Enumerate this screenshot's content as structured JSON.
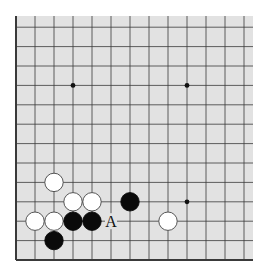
{
  "diagram": {
    "type": "go-board-fragment",
    "board": {
      "background": "#e2e2e2",
      "line_color": "#3a3a3a",
      "columns_visible": 13,
      "rows_visible": 13,
      "edges": [
        "left",
        "bottom"
      ]
    },
    "star_points": [
      {
        "col": 3,
        "row": 9
      },
      {
        "col": 9,
        "row": 9
      },
      {
        "col": 9,
        "row": 3
      }
    ],
    "stones": [
      {
        "color": "white",
        "col": 2,
        "row": 4
      },
      {
        "color": "white",
        "col": 3,
        "row": 3
      },
      {
        "color": "white",
        "col": 4,
        "row": 3
      },
      {
        "color": "white",
        "col": 1,
        "row": 2
      },
      {
        "color": "white",
        "col": 2,
        "row": 2
      },
      {
        "color": "black",
        "col": 3,
        "row": 2
      },
      {
        "color": "black",
        "col": 4,
        "row": 2
      },
      {
        "color": "black",
        "col": 2,
        "row": 1
      },
      {
        "color": "black",
        "col": 6,
        "row": 3
      },
      {
        "color": "white",
        "col": 8,
        "row": 2
      }
    ],
    "markers": [
      {
        "text": "A",
        "col": 5,
        "row": 2
      }
    ]
  }
}
